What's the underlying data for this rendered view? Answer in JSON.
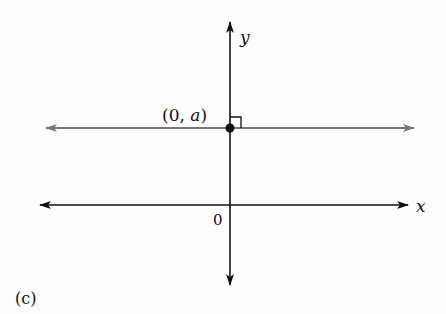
{
  "figure": {
    "panel_label": "(c)",
    "axes": {
      "x_label": "x",
      "y_label": "y",
      "origin_label": "0"
    },
    "line": {
      "description": "horizontal line y = a",
      "point_label": "(0, a)",
      "point_label_prefix": "(0, ",
      "point_label_var": "a",
      "point_label_suffix": ")",
      "color": "#777777"
    },
    "axis_color": "#111111",
    "right_angle_marker": true
  }
}
